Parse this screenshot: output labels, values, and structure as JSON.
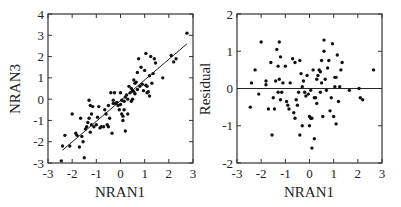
{
  "chart_data": [
    {
      "type": "scatter",
      "title": "",
      "xlabel": "NRAN1",
      "ylabel": "NRAN3",
      "xlim": [
        -3,
        3
      ],
      "ylim": [
        -3,
        4
      ],
      "xticks": [
        -3,
        -2,
        -1,
        0,
        1,
        2,
        3
      ],
      "yticks": [
        -3,
        -2,
        -1,
        0,
        1,
        2,
        3,
        4
      ],
      "grid": false,
      "legend": null,
      "fit_line": {
        "x": [
          -2.4,
          2.75
        ],
        "y": [
          -2.4,
          2.6
        ]
      },
      "x": [
        -2.45,
        -2.4,
        -2.3,
        -2.1,
        -2.0,
        -1.85,
        -1.8,
        -1.7,
        -1.65,
        -1.6,
        -1.55,
        -1.5,
        -1.45,
        -1.4,
        -1.35,
        -1.3,
        -1.3,
        -1.25,
        -1.25,
        -1.2,
        -1.2,
        -1.15,
        -1.1,
        -1.0,
        -0.95,
        -0.9,
        -0.85,
        -0.8,
        -0.7,
        -0.65,
        -0.6,
        -0.55,
        -0.5,
        -0.5,
        -0.45,
        -0.4,
        -0.35,
        -0.3,
        -0.3,
        -0.25,
        -0.2,
        -0.15,
        -0.1,
        -0.05,
        0.0,
        0.0,
        0.05,
        0.05,
        0.1,
        0.1,
        0.15,
        0.15,
        0.2,
        0.2,
        0.25,
        0.3,
        0.3,
        0.35,
        0.4,
        0.45,
        0.45,
        0.5,
        0.5,
        0.55,
        0.55,
        0.6,
        0.6,
        0.65,
        0.7,
        0.7,
        0.75,
        0.8,
        0.85,
        0.9,
        0.95,
        1.0,
        1.05,
        1.05,
        1.1,
        1.1,
        1.15,
        1.2,
        1.2,
        1.25,
        1.3,
        1.35,
        1.4,
        1.45,
        1.75,
        2.1,
        2.2,
        2.3,
        2.75
      ],
      "y": [
        -2.9,
        -2.2,
        -1.7,
        -2.2,
        -0.7,
        -1.6,
        -1.7,
        -2.25,
        -0.9,
        -1.75,
        -2.0,
        -2.75,
        -1.4,
        -1.3,
        -1.1,
        -0.05,
        -0.9,
        -0.3,
        -1.55,
        -1.2,
        -0.7,
        -0.35,
        -1.3,
        -1.2,
        -0.85,
        -0.35,
        -1.35,
        -1.3,
        -1.3,
        -0.5,
        -0.7,
        -1.2,
        -0.3,
        -1.3,
        -0.9,
        0.3,
        -1.6,
        -0.05,
        -0.2,
        0.3,
        -0.2,
        -0.15,
        -0.3,
        -0.5,
        -0.25,
        0.3,
        -0.7,
        -0.05,
        -0.8,
        -1.0,
        -0.5,
        -0.1,
        0.1,
        -1.5,
        0.2,
        -0.7,
        0.0,
        0.6,
        0.3,
        -0.1,
        0.5,
        0.4,
        0.0,
        0.9,
        0.35,
        0.75,
        0.25,
        0.8,
        0.45,
        1.25,
        1.9,
        0.6,
        1.5,
        0.7,
        0.4,
        1.35,
        2.15,
        0.65,
        0.3,
        0.6,
        0.35,
        0.15,
        1.1,
        2.0,
        0.75,
        1.2,
        1.9,
        1.7,
        1.0,
        2.05,
        1.75,
        1.9,
        3.1
      ]
    },
    {
      "type": "scatter",
      "title": "",
      "xlabel": "NRAN1",
      "ylabel": "Residual",
      "xlim": [
        -3,
        3
      ],
      "ylim": [
        -2,
        2
      ],
      "xticks": [
        -3,
        -2,
        -1,
        0,
        1,
        2,
        3
      ],
      "yticks": [
        -2,
        -1,
        0,
        1,
        2
      ],
      "grid": false,
      "legend": null,
      "zero_line": 0,
      "x": [
        -2.45,
        -2.4,
        -2.25,
        -2.1,
        -2.0,
        -1.8,
        -1.8,
        -1.7,
        -1.6,
        -1.55,
        -1.5,
        -1.45,
        -1.4,
        -1.35,
        -1.3,
        -1.3,
        -1.25,
        -1.25,
        -1.2,
        -1.2,
        -1.15,
        -1.1,
        -1.0,
        -0.95,
        -0.9,
        -0.85,
        -0.8,
        -0.7,
        -0.65,
        -0.6,
        -0.6,
        -0.55,
        -0.5,
        -0.45,
        -0.4,
        -0.4,
        -0.35,
        -0.3,
        -0.3,
        -0.25,
        -0.2,
        -0.15,
        -0.1,
        -0.05,
        0.0,
        0.0,
        0.05,
        0.05,
        0.1,
        0.1,
        0.15,
        0.2,
        0.2,
        0.25,
        0.3,
        0.3,
        0.35,
        0.4,
        0.45,
        0.45,
        0.5,
        0.5,
        0.55,
        0.6,
        0.6,
        0.65,
        0.7,
        0.75,
        0.8,
        0.85,
        0.9,
        0.95,
        1.0,
        1.05,
        1.05,
        1.1,
        1.1,
        1.15,
        1.2,
        1.25,
        1.3,
        1.35,
        1.65,
        2.05,
        2.1,
        2.2,
        2.65
      ],
      "y": [
        -0.5,
        0.15,
        0.5,
        -0.15,
        1.25,
        0.2,
        0.1,
        -0.55,
        0.7,
        -1.25,
        -0.25,
        -0.55,
        0.2,
        1.05,
        0.6,
        -0.1,
        1.25,
        0.25,
        0.85,
        -0.3,
        -0.1,
        0.15,
        0.6,
        -0.35,
        -0.45,
        -0.55,
        0.15,
        0.8,
        -0.65,
        0.7,
        -0.8,
        -0.3,
        -0.45,
        -0.1,
        0.75,
        -1.25,
        0.4,
        -1.0,
        0.05,
        0.2,
        -0.1,
        -0.2,
        0.35,
        -0.15,
        -0.75,
        -1.0,
        -0.8,
        -0.05,
        -1.6,
        -0.8,
        0.5,
        -0.25,
        -1.35,
        -0.25,
        -0.4,
        0.25,
        0.35,
        0.5,
        -0.1,
        0.45,
        0.75,
        0.15,
        -0.75,
        1.3,
        1.0,
        0.25,
        -0.05,
        0.55,
        0.75,
        -0.6,
        -0.25,
        1.2,
        -0.75,
        0.05,
        0.3,
        0.3,
        -0.95,
        0.9,
        -0.35,
        0.05,
        0.5,
        0.7,
        -0.05,
        0.0,
        -0.25,
        -0.3,
        0.5
      ]
    }
  ],
  "plots": {
    "left": {
      "xlabel": "NRAN1",
      "ylabel": "NRAN3",
      "xtick_labels": [
        "-3",
        "-2",
        "-1",
        "0",
        "1",
        "2",
        "3"
      ],
      "ytick_labels": [
        "-3",
        "-2",
        "-1",
        "0",
        "1",
        "2",
        "3",
        "4"
      ]
    },
    "right": {
      "xlabel": "NRAN1",
      "ylabel": "Residual",
      "xtick_labels": [
        "-3",
        "-2",
        "-1",
        "0",
        "1",
        "2",
        "3"
      ],
      "ytick_labels": [
        "-2",
        "-1",
        "0",
        "1",
        "2"
      ]
    }
  }
}
